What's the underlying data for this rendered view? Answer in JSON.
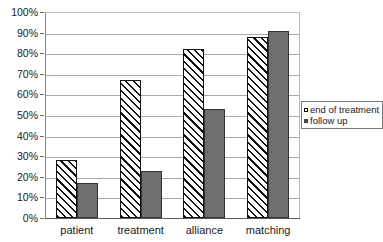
{
  "chart_data": {
    "type": "bar",
    "title": "",
    "xlabel": "",
    "ylabel": "",
    "ylim": [
      0,
      100
    ],
    "ytick_labels": [
      "100%",
      "90%",
      "80%",
      "70%",
      "60%",
      "50%",
      "40%",
      "30%",
      "20%",
      "10%",
      "0%"
    ],
    "ytick_values": [
      100,
      90,
      80,
      70,
      60,
      50,
      40,
      30,
      20,
      10,
      0
    ],
    "categories": [
      "patient",
      "treatment",
      "alliance",
      "matching"
    ],
    "grid": "horizontal",
    "legend_position": "right-middle",
    "series": [
      {
        "name": "end of treatment",
        "style": "diagonal-hatch",
        "color": "#ffffff",
        "values": [
          28,
          67,
          82,
          88
        ]
      },
      {
        "name": "follow up",
        "style": "solid",
        "color": "#6e6e6e",
        "values": [
          17,
          23,
          53,
          91
        ]
      }
    ]
  },
  "legend": {
    "items": [
      {
        "label": "end of treatment",
        "marker": "hatch-swatch-icon"
      },
      {
        "label": "follow up",
        "marker": "solid-swatch-icon"
      }
    ]
  }
}
